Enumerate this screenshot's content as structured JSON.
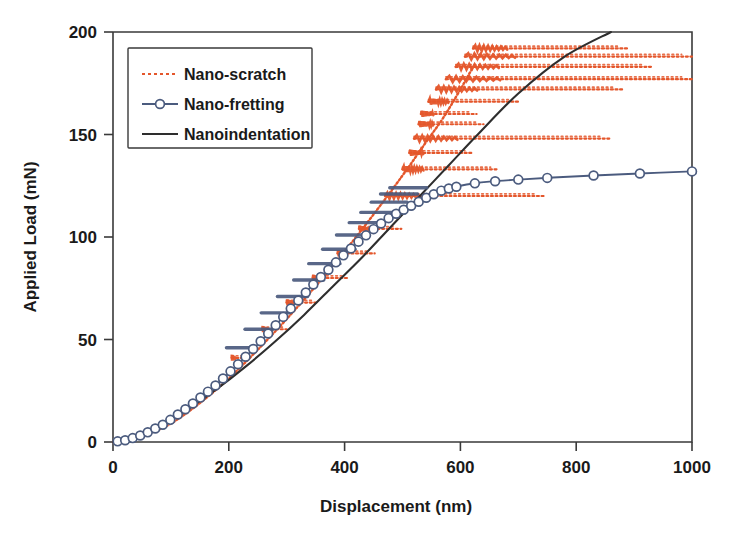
{
  "chart_data": {
    "type": "line",
    "title": "",
    "xlabel": "Displacement (nm)",
    "ylabel": "Applied Load (mN)",
    "xlim": [
      0,
      1000
    ],
    "ylim": [
      0,
      200
    ],
    "xticks": [
      0,
      200,
      400,
      600,
      800,
      1000
    ],
    "yticks": [
      0,
      50,
      100,
      150,
      200
    ],
    "grid": false,
    "legend_position": "top-left",
    "series": [
      {
        "name": "Nano-scratch",
        "color": "#E4562B",
        "style": "dotted",
        "marker": "none",
        "description": "Reciprocating scratch test: load ramps along the indentation envelope while the tip sweeps back and forth horizontally, producing nested horizontal excursions of growing amplitude at progressively higher loads.",
        "envelope_x": [
          0,
          30,
          60,
          100,
          150,
          200,
          250,
          300,
          350,
          400,
          450,
          500,
          540,
          570,
          600,
          620
        ],
        "envelope_y": [
          0,
          1,
          4,
          9,
          19,
          31,
          45,
          60,
          76,
          93,
          111,
          130,
          146,
          158,
          172,
          182
        ],
        "sweeps": [
          {
            "load": 41,
            "x_start": 205,
            "x_end": 232
          },
          {
            "load": 55,
            "x_start": 258,
            "x_end": 300
          },
          {
            "load": 68,
            "x_start": 300,
            "x_end": 352
          },
          {
            "load": 80,
            "x_start": 345,
            "x_end": 408
          },
          {
            "load": 92,
            "x_start": 388,
            "x_end": 452
          },
          {
            "load": 104,
            "x_start": 425,
            "x_end": 498
          },
          {
            "load": 120,
            "x_start": 470,
            "x_end": 745
          },
          {
            "load": 133,
            "x_start": 500,
            "x_end": 665
          },
          {
            "load": 141,
            "x_start": 512,
            "x_end": 620
          },
          {
            "load": 148,
            "x_start": 520,
            "x_end": 860
          },
          {
            "load": 155,
            "x_start": 528,
            "x_end": 640
          },
          {
            "load": 160,
            "x_start": 532,
            "x_end": 628
          },
          {
            "load": 166,
            "x_start": 545,
            "x_end": 700
          },
          {
            "load": 172,
            "x_start": 558,
            "x_end": 880
          },
          {
            "load": 177,
            "x_start": 575,
            "x_end": 1000
          },
          {
            "load": 183,
            "x_start": 592,
            "x_end": 930
          },
          {
            "load": 188,
            "x_start": 608,
            "x_end": 1000
          },
          {
            "load": 192,
            "x_start": 622,
            "x_end": 890
          }
        ]
      },
      {
        "name": "Nano-fretting",
        "color": "#4B5B7E",
        "style": "solid-with-open-circles",
        "marker": "open-circle",
        "description": "Load ramps with small reciprocating fretting strokes overlaid, then the response rolls over into a plateau near 125-132 mN beyond about 600 nm.",
        "x": [
          0,
          25,
          55,
          90,
          130,
          175,
          220,
          265,
          310,
          350,
          390,
          425,
          455,
          480,
          500,
          520,
          540,
          555,
          570,
          585,
          600,
          620,
          650,
          700,
          760,
          830,
          910,
          1000
        ],
        "y": [
          0,
          1,
          4,
          9,
          17,
          27,
          39,
          52,
          66,
          78,
          89,
          98,
          105,
          110,
          113,
          116,
          119,
          121,
          123,
          124,
          125,
          126,
          127,
          128,
          129,
          130,
          131,
          132
        ],
        "fretting_strokes": [
          {
            "load": 46,
            "x_start": 196,
            "x_end": 244
          },
          {
            "load": 55,
            "x_start": 228,
            "x_end": 276
          },
          {
            "load": 63,
            "x_start": 256,
            "x_end": 306
          },
          {
            "load": 71,
            "x_start": 284,
            "x_end": 336
          },
          {
            "load": 79,
            "x_start": 312,
            "x_end": 364
          },
          {
            "load": 87,
            "x_start": 338,
            "x_end": 392
          },
          {
            "load": 94,
            "x_start": 362,
            "x_end": 418
          },
          {
            "load": 101,
            "x_start": 386,
            "x_end": 442
          },
          {
            "load": 107,
            "x_start": 408,
            "x_end": 466
          },
          {
            "load": 112,
            "x_start": 428,
            "x_end": 488
          },
          {
            "load": 117,
            "x_start": 446,
            "x_end": 508
          },
          {
            "load": 121,
            "x_start": 462,
            "x_end": 526
          },
          {
            "load": 124,
            "x_start": 478,
            "x_end": 542
          }
        ]
      },
      {
        "name": "Nanoindentation",
        "color": "#2E2E2E",
        "style": "solid",
        "marker": "none",
        "description": "Smooth monotonic loading curve, slightly convex near the origin then essentially linear up to the top of the axis.",
        "x": [
          0,
          25,
          55,
          90,
          130,
          180,
          230,
          280,
          330,
          380,
          430,
          480,
          530,
          580,
          630,
          700,
          780,
          860
        ],
        "y": [
          0,
          1,
          4,
          9,
          16,
          26,
          37,
          49,
          62,
          76,
          90,
          105,
          120,
          135,
          150,
          170,
          188,
          200
        ]
      }
    ]
  },
  "legend": {
    "items": [
      {
        "label": "Nano-scratch",
        "color": "#E4562B",
        "style": "dotted"
      },
      {
        "label": "Nano-fretting",
        "color": "#4B5B7E",
        "style": "circle"
      },
      {
        "label": "Nanoindentation",
        "color": "#2E2E2E",
        "style": "solid"
      }
    ]
  },
  "axes": {
    "x_title": "Displacement (nm)",
    "y_title": "Applied Load (mN)",
    "x_tick_labels": [
      "0",
      "200",
      "400",
      "600",
      "800",
      "1000"
    ],
    "y_tick_labels": [
      "0",
      "50",
      "100",
      "150",
      "200"
    ]
  }
}
